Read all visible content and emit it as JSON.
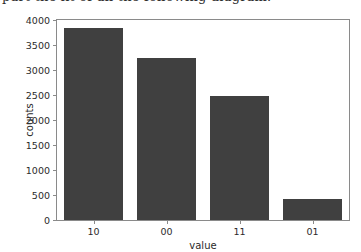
{
  "page": {
    "background_color": "#ffffff",
    "top_text_remnant": "part the lit of all the following diagram."
  },
  "chart_data": {
    "type": "bar",
    "title": "",
    "categories": [
      "10",
      "00",
      "11",
      "01"
    ],
    "values": [
      3850,
      3250,
      2490,
      430
    ],
    "series": [
      {
        "name": "counts",
        "values": [
          3850,
          3250,
          2490,
          430
        ]
      }
    ],
    "xlabel": "value",
    "ylabel": "counts",
    "ylim": [
      0,
      4000
    ],
    "ytick_values": [
      0,
      500,
      1000,
      1500,
      2000,
      2500,
      3000,
      3500,
      4000
    ],
    "ytick_labels": [
      "0",
      "500",
      "1000",
      "1500",
      "2000",
      "2500",
      "3000",
      "3500",
      "4000"
    ],
    "xtick_labels": [
      "10",
      "00",
      "11",
      "01"
    ],
    "grid": false,
    "legend": false,
    "bar_color": "#404040",
    "axis_color": "#8a8a8a",
    "frame": true
  }
}
